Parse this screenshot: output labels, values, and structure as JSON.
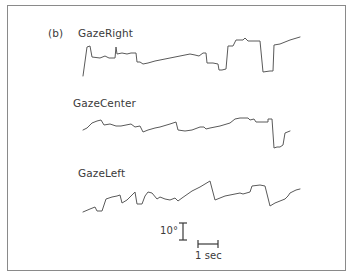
{
  "figure": {
    "panel_label": "(b)"
  },
  "chart_data": {
    "type": "line",
    "title": "",
    "panel": "(b)",
    "xlabel": "",
    "ylabel": "",
    "grid": false,
    "legend": "none (traces labeled inline above each trace)",
    "units": {
      "x": "time (s), approx. 20 px per 1 sec",
      "y": "gaze angle (deg), approx. 17 px per 10°"
    },
    "scale_bars": {
      "vertical": {
        "label": "10°",
        "value": 10,
        "unit": "deg"
      },
      "horizontal": {
        "label": "1 sec",
        "value": 1,
        "unit": "s"
      }
    },
    "series": [
      {
        "name": "GazeRight",
        "points_px": [
          [
            83,
            76
          ],
          [
            87,
            47
          ],
          [
            90,
            46
          ],
          [
            92,
            57
          ],
          [
            100,
            58
          ],
          [
            105,
            56
          ],
          [
            109,
            58
          ],
          [
            115,
            58
          ],
          [
            116,
            47
          ],
          [
            117,
            54
          ],
          [
            122,
            53
          ],
          [
            127,
            54
          ],
          [
            131,
            53
          ],
          [
            136,
            53
          ],
          [
            137,
            62
          ],
          [
            140,
            62
          ],
          [
            143,
            64
          ],
          [
            148,
            63
          ],
          [
            155,
            61
          ],
          [
            165,
            59
          ],
          [
            175,
            57
          ],
          [
            185,
            55
          ],
          [
            190,
            54
          ],
          [
            195,
            55
          ],
          [
            199,
            56
          ],
          [
            203,
            53
          ],
          [
            206,
            53
          ],
          [
            207,
            63
          ],
          [
            213,
            63
          ],
          [
            218,
            64
          ],
          [
            219,
            70
          ],
          [
            222,
            70
          ],
          [
            226,
            69
          ],
          [
            228,
            46
          ],
          [
            233,
            46
          ],
          [
            236,
            40
          ],
          [
            243,
            40
          ],
          [
            245,
            38
          ],
          [
            248,
            41
          ],
          [
            255,
            41
          ],
          [
            260,
            41
          ],
          [
            263,
            72
          ],
          [
            270,
            71
          ],
          [
            273,
            71
          ],
          [
            274,
            45
          ],
          [
            280,
            44
          ],
          [
            285,
            42
          ],
          [
            290,
            40
          ],
          [
            300,
            37
          ]
        ]
      },
      {
        "name": "GazeCenter",
        "points_px": [
          [
            83,
            130
          ],
          [
            87,
            128
          ],
          [
            92,
            123
          ],
          [
            97,
            121
          ],
          [
            101,
            120
          ],
          [
            104,
            125
          ],
          [
            110,
            124
          ],
          [
            116,
            126
          ],
          [
            121,
            126
          ],
          [
            126,
            125
          ],
          [
            131,
            124
          ],
          [
            135,
            127
          ],
          [
            140,
            126
          ],
          [
            143,
            132
          ],
          [
            148,
            130
          ],
          [
            155,
            128
          ],
          [
            160,
            127
          ],
          [
            170,
            124
          ],
          [
            176,
            122
          ],
          [
            178,
            130
          ],
          [
            185,
            131
          ],
          [
            192,
            130
          ],
          [
            200,
            127
          ],
          [
            204,
            127
          ],
          [
            206,
            129
          ],
          [
            210,
            128
          ],
          [
            220,
            126
          ],
          [
            230,
            123
          ],
          [
            235,
            119
          ],
          [
            240,
            118
          ],
          [
            248,
            118
          ],
          [
            250,
            120
          ],
          [
            254,
            119
          ],
          [
            256,
            122
          ],
          [
            262,
            122
          ],
          [
            268,
            122
          ],
          [
            268,
            119
          ],
          [
            272,
            119
          ],
          [
            274,
            148
          ],
          [
            277,
            147
          ],
          [
            280,
            147
          ],
          [
            283,
            145
          ],
          [
            285,
            133
          ],
          [
            290,
            131
          ]
        ]
      },
      {
        "name": "GazeLeft",
        "points_px": [
          [
            83,
            212
          ],
          [
            90,
            209
          ],
          [
            95,
            207
          ],
          [
            97,
            211
          ],
          [
            102,
            211
          ],
          [
            106,
            199
          ],
          [
            112,
            197
          ],
          [
            117,
            196
          ],
          [
            120,
            195
          ],
          [
            122,
            203
          ],
          [
            127,
            200
          ],
          [
            130,
            197
          ],
          [
            135,
            192
          ],
          [
            137,
            204
          ],
          [
            142,
            204
          ],
          [
            145,
            196
          ],
          [
            148,
            192
          ],
          [
            152,
            193
          ],
          [
            157,
            199
          ],
          [
            160,
            197
          ],
          [
            165,
            199
          ],
          [
            170,
            200
          ],
          [
            175,
            198
          ],
          [
            178,
            201
          ],
          [
            182,
            198
          ],
          [
            192,
            191
          ],
          [
            200,
            187
          ],
          [
            210,
            181
          ],
          [
            215,
            200
          ],
          [
            225,
            196
          ],
          [
            240,
            193
          ],
          [
            243,
            194
          ],
          [
            250,
            192
          ],
          [
            252,
            186
          ],
          [
            260,
            185
          ],
          [
            265,
            186
          ],
          [
            270,
            206
          ],
          [
            275,
            203
          ],
          [
            280,
            201
          ],
          [
            285,
            199
          ],
          [
            288,
            196
          ],
          [
            290,
            193
          ],
          [
            296,
            190
          ],
          [
            300,
            189
          ]
        ]
      }
    ]
  },
  "labels": {
    "gaze_right": "GazeRight",
    "gaze_center": "GazeCenter",
    "gaze_left": "GazeLeft",
    "scale_vertical": "10°",
    "scale_horizontal": "1 sec"
  }
}
